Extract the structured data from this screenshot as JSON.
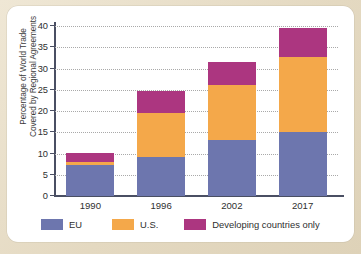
{
  "figure": {
    "panel_background": "#ffffff",
    "page_background": "#e6dcc6"
  },
  "chart_data": {
    "type": "bar",
    "stacked": true,
    "title": "",
    "xlabel": "",
    "ylabel": "Percentage of World Trade Covered by Regional Agreements",
    "ylabel_line1": "Percentage of World Trade",
    "ylabel_line2": "Covered by Regional Agreements",
    "categories": [
      "1990",
      "1996",
      "2002",
      "2017"
    ],
    "ylim": [
      0,
      40
    ],
    "yticks": [
      0,
      5,
      10,
      15,
      20,
      25,
      30,
      35,
      40
    ],
    "ytick_labels": [
      "0",
      "5",
      "10",
      "15",
      "20",
      "25",
      "30",
      "35",
      "40"
    ],
    "grid": true,
    "grid_style": "dotted",
    "legend_position": "bottom",
    "series": [
      {
        "name": "EU",
        "color": "#6d76ae",
        "values": [
          7.3,
          9.2,
          13.2,
          15.0
        ]
      },
      {
        "name": "U.S.",
        "color": "#f4a84a",
        "values": [
          0.8,
          10.3,
          13.0,
          17.7
        ]
      },
      {
        "name": "Developing countries only",
        "color": "#ac3680",
        "values": [
          2.1,
          5.3,
          5.3,
          6.8
        ]
      }
    ],
    "totals": [
      10.2,
      24.8,
      31.5,
      39.5
    ]
  },
  "legend": {
    "items": [
      {
        "label": "EU",
        "color": "#6d76ae"
      },
      {
        "label": "U.S.",
        "color": "#f4a84a"
      },
      {
        "label": "Developing countries only",
        "color": "#ac3680"
      }
    ]
  }
}
